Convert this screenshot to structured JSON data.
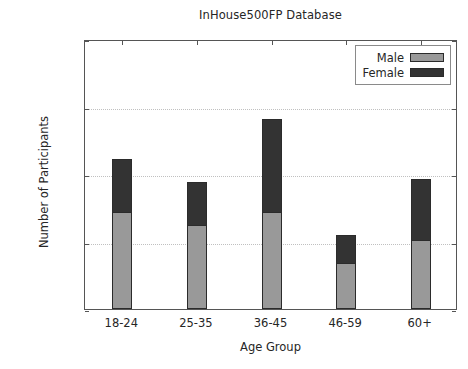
{
  "chart_data": {
    "type": "bar",
    "subtype": "stacked-vertical-bar",
    "title": "InHouse500FP Database",
    "xlabel": "Age Group",
    "ylabel": "Number of Participants",
    "categories": [
      "18-24",
      "25-35",
      "36-45",
      "46-59",
      "60+"
    ],
    "series": [
      {
        "name": "Male",
        "color": "#999999",
        "values": [
          72,
          62,
          72,
          34,
          51
        ]
      },
      {
        "name": "Female",
        "color": "#333333",
        "values": [
          39,
          32,
          69,
          21,
          45
        ]
      }
    ],
    "totals": [
      111,
      94,
      141,
      55,
      96
    ],
    "ylim": [
      0,
      200
    ],
    "yticks": [
      0,
      50,
      100,
      150,
      200
    ],
    "ytick_labels": [
      "0",
      "50",
      "100",
      "150",
      "200"
    ],
    "grid": "horizontal-dotted",
    "legend_position": "upper-right",
    "legend_entries": [
      "Male",
      "Female"
    ]
  }
}
